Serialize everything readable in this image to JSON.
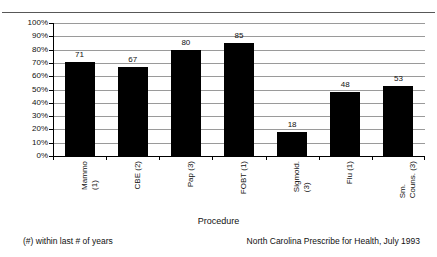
{
  "chart_data": {
    "type": "bar",
    "title": "",
    "subtitle": "",
    "xlabel": "Procedure",
    "ylabel": "",
    "ylim": [
      0,
      100
    ],
    "ytick_labels": [
      "100%",
      "90%",
      "80%",
      "70%",
      "60%",
      "50%",
      "40%",
      "30%",
      "20%",
      "10%",
      "0%"
    ],
    "ytick_values": [
      100,
      90,
      80,
      70,
      60,
      50,
      40,
      30,
      20,
      10,
      0
    ],
    "grid": true,
    "legend": "none",
    "bar_color": "#000000",
    "categories": [
      "Mammo (1)",
      "CBE (2)",
      "Pap (3)",
      "FOBT (1)",
      "Sigmoid. (3)",
      "Flu (1)",
      "Sm. Couns. (3)"
    ],
    "category_lines": [
      [
        "Mammo",
        "(1)"
      ],
      [
        "CBE (2)",
        ""
      ],
      [
        "Pap (3)",
        ""
      ],
      [
        "FOBT (1)",
        ""
      ],
      [
        "Sigmoid.",
        "(3)"
      ],
      [
        "Flu (1)",
        ""
      ],
      [
        "Sm.",
        "Couns. (3)"
      ]
    ],
    "values": [
      71,
      67,
      80,
      85,
      18,
      48,
      53
    ],
    "data_labels": [
      "71",
      "67",
      "80",
      "85",
      "18",
      "48",
      "53"
    ]
  },
  "notes": {
    "footnote": "(#) within last # of years",
    "source": "North Carolina Prescribe for Health, July 1993"
  }
}
